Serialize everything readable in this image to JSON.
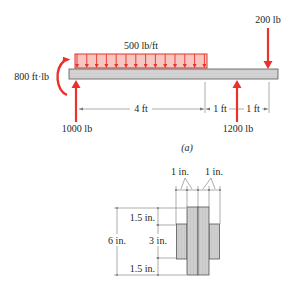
{
  "figure": {
    "caption": "(a)",
    "colors": {
      "load_red": "#e8322b",
      "load_fill": "#f6c6c0",
      "beam_fill": "#d6d6d6",
      "beam_stroke": "#555555",
      "section_fill": "#cfcfcf",
      "text": "#231f20"
    },
    "beam": {
      "distributed_load_label": "500 lb/ft",
      "moment_label": "800 ft·lb",
      "point_load_top_label": "200 lb",
      "reaction_left_label": "1000 lb",
      "reaction_right_label": "1200 lb",
      "dimensions": [
        "4 ft",
        "1 ft",
        "1 ft"
      ]
    },
    "cross_section": {
      "top_dims": [
        "1 in.",
        "1 in."
      ],
      "overall_height_label": "6 in.",
      "segment_labels": [
        "1.5 in.",
        "3 in.",
        "1.5 in."
      ]
    }
  }
}
